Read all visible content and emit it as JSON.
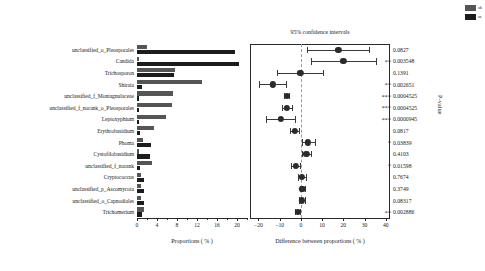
{
  "legend": {
    "items": [
      {
        "label": "sh",
        "color": "#555555"
      },
      {
        "label": "sc",
        "color": "#1c1c1c"
      }
    ]
  },
  "left_panel": {
    "xlabel": "Proportions ( % )",
    "ticks": [
      "0",
      "4",
      "8",
      "12",
      "16",
      "20"
    ]
  },
  "right_panel": {
    "title": "95% confidence intervals",
    "xlabel": "Difference between proportions ( % )",
    "ticks": [
      "-20",
      "-10",
      "0",
      "10",
      "20",
      "30",
      "40"
    ],
    "pvalue_header": "P-value"
  },
  "chart_data": {
    "type": "bar",
    "title": "95% confidence intervals",
    "xlabel": "Proportions ( % )",
    "ylabel": "",
    "xlim": [
      0,
      22
    ],
    "ci_xlim": [
      -24,
      42
    ],
    "ci_xlabel": "Difference between proportions ( % )",
    "grid": false,
    "legend_position": "top-right",
    "categories": [
      "unclassified_o_Pleosporales",
      "Candida",
      "Trichosporon",
      "Shiraia",
      "unclassified_f_Montagnulaceae",
      "unclassified_f_norank_o_Pleosporales",
      "Leptoxyphium",
      "Erythrobasidium",
      "Phoma",
      "Cystofilobasidium",
      "unclassified_f_norank",
      "Cryptococcus",
      "unclassified_p_Ascomycota",
      "unclassified_o_Capnodiales",
      "Trichomerium"
    ],
    "series": [
      {
        "name": "sh",
        "color": "#555555",
        "values": [
          1.9,
          0.35,
          7.5,
          13.0,
          7.2,
          6.9,
          5.8,
          3.4,
          1.2,
          0.35,
          2.9,
          0.85,
          0.75,
          0.8,
          1.45
        ]
      },
      {
        "name": "sc",
        "color": "#1c1c1c",
        "values": [
          19.6,
          20.4,
          7.3,
          1.0,
          0.45,
          0.4,
          0.35,
          0.5,
          2.8,
          2.6,
          0.5,
          1.3,
          1.45,
          1.3,
          1.0
        ]
      }
    ],
    "ci": {
      "estimates": [
        17.7,
        20.0,
        -0.2,
        -13.2,
        -6.7,
        -6.5,
        -9.4,
        -2.9,
        3.4,
        2.5,
        -2.4,
        0.4,
        0.7,
        0.5,
        -1.5
      ],
      "lower": [
        3.0,
        4.6,
        -11.2,
        -19.6,
        -7.9,
        -9.0,
        -16.4,
        -5.0,
        0.5,
        0.6,
        -4.6,
        -1.5,
        -0.2,
        -0.9,
        -2.6
      ],
      "upper": [
        32.0,
        35.5,
        10.2,
        -7.1,
        -5.4,
        -4.0,
        -2.6,
        -0.9,
        6.6,
        4.6,
        -0.4,
        2.4,
        1.7,
        1.9,
        -0.5
      ]
    },
    "pvalues": [
      "0.0827",
      "0.003548",
      "0.1391",
      "0.002651",
      "0.0004525",
      "0.0004525",
      "0.0000945",
      "0.0817",
      "0.03839",
      "0.4103",
      "0.01598",
      "0.7674",
      "0.3749",
      "0.08317",
      "0.002886"
    ],
    "significance": [
      "",
      "**",
      "",
      "**",
      "***",
      "***",
      "***",
      "",
      "*",
      "",
      "*",
      "",
      "",
      "",
      "**"
    ]
  }
}
